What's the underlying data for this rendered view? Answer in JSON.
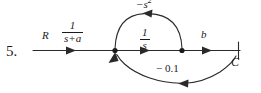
{
  "diagram": {
    "problem_number": "5.",
    "type": "signal-flow-graph",
    "input_label": "R",
    "output_label": "C",
    "forward_gain_1": {
      "numerator": "1",
      "denominator": "s+a"
    },
    "forward_gain_2": {
      "numerator": "1",
      "denominator": "s"
    },
    "output_gain": "b",
    "feedback_upper": {
      "text": "−s",
      "exponent": "2"
    },
    "feedback_lower": "− 0.1",
    "colors": {
      "background": "#ffffff",
      "ink": "#1a1a1a",
      "wire": "#2a2a2a"
    }
  }
}
